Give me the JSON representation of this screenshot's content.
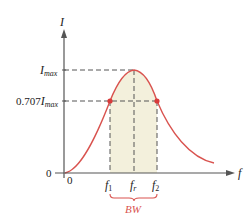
{
  "diagram": {
    "axes": {
      "y_label": "I",
      "x_label": "f",
      "y_origin_label": "0",
      "x_origin_label": "0"
    },
    "y_levels": {
      "max": {
        "main": "I",
        "sub": "max"
      },
      "half_power": {
        "prefix": "0.707",
        "main": "I",
        "sub": "max"
      }
    },
    "x_marks": {
      "f1": {
        "main": "f",
        "sub": "1"
      },
      "fr": {
        "main": "f",
        "sub": "r"
      },
      "f2": {
        "main": "f",
        "sub": "2"
      }
    },
    "bandwidth_label": "BW",
    "colors": {
      "curve": "#d9534f",
      "points": "#d93a3a",
      "shaded_region": "#f3f0dc",
      "axes": "#555555",
      "dashed": "#555555",
      "bw_label": "#d9534f"
    }
  }
}
